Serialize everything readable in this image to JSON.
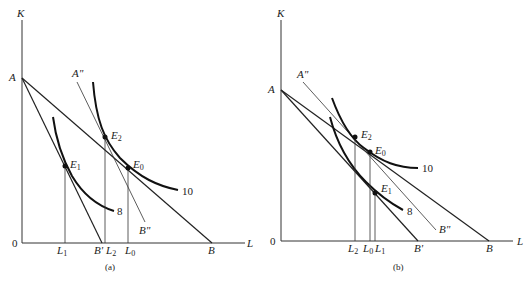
{
  "panel_a": {
    "caption": "(a)",
    "y_axis": "K",
    "x_axis": "L",
    "origin": "0",
    "points": {
      "A": "A",
      "A2": "A\"",
      "B": "B",
      "B1": "B'",
      "B2": "B\""
    },
    "equilibria": {
      "E0": "E",
      "E0_sub": "0",
      "E1": "E",
      "E1_sub": "1",
      "E2": "E",
      "E2_sub": "2"
    },
    "ticks": {
      "L1": "L",
      "L1_sub": "1",
      "L2": "L",
      "L2_sub": "2",
      "L0": "L",
      "L0_sub": "0"
    },
    "isoquants": {
      "high": "10",
      "low": "8"
    }
  },
  "panel_b": {
    "caption": "(b)",
    "y_axis": "K",
    "x_axis": "L",
    "origin": "0",
    "points": {
      "A": "A",
      "A2": "A\"",
      "B": "B",
      "B1": "B'",
      "B2": "B\""
    },
    "equilibria": {
      "E0": "E",
      "E0_sub": "0",
      "E1": "E",
      "E1_sub": "1",
      "E2": "E",
      "E2_sub": "2"
    },
    "ticks": {
      "L1": "L",
      "L1_sub": "1",
      "L2": "L",
      "L2_sub": "2",
      "L0": "L",
      "L0_sub": "0"
    },
    "isoquants": {
      "high": "10",
      "low": "8"
    }
  }
}
